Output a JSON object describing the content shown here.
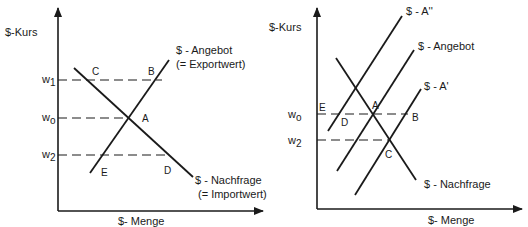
{
  "left_diagram": {
    "y_axis_label": "$-Kurs",
    "x_axis_label": "$- Menge",
    "supply_label": "$ - Angebot",
    "supply_sublabel": "(= Exportwert)",
    "demand_label": "$ - Nachfrage",
    "demand_sublabel": "(= Importwert)",
    "price_levels": [
      {
        "base": "w",
        "sub": "1"
      },
      {
        "base": "w",
        "sub": "o"
      },
      {
        "base": "w",
        "sub": "2"
      }
    ],
    "points": {
      "A": "A",
      "B": "B",
      "C": "C",
      "D": "D",
      "E": "E"
    }
  },
  "right_diagram": {
    "y_axis_label": "$-Kurs",
    "x_axis_label": "$- Menge",
    "supply_shift_up_label": "$ - A''",
    "supply_label": "$ - Angebot",
    "supply_shift_down_label": "$ - A'",
    "demand_label": "$ - Nachfrage",
    "price_levels": [
      {
        "base": "w",
        "sub": "o"
      },
      {
        "base": "w",
        "sub": "2"
      }
    ],
    "points": {
      "A": "A",
      "B": "B",
      "C": "C",
      "D": "D",
      "E": "E"
    }
  },
  "colors": {
    "line": "#1a1a1a",
    "background": "#ffffff"
  }
}
